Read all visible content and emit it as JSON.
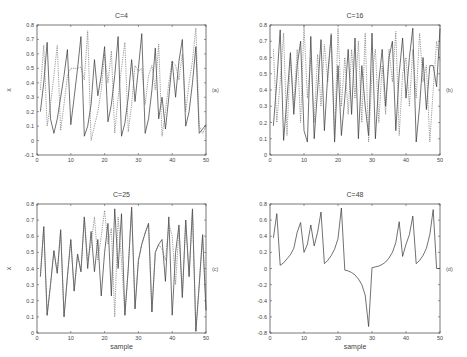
{
  "chart_data": [
    {
      "type": "line",
      "id": "a",
      "title": "C=4",
      "panel_label": "(a)",
      "xlabel": "",
      "ylabel": "x",
      "xlim": [
        0,
        50
      ],
      "ylim": [
        -0.1,
        0.8
      ],
      "xticks": [
        0,
        10,
        20,
        30,
        40,
        50
      ],
      "xtick_labels": [
        "0",
        "10",
        "20",
        "30",
        "40",
        "50"
      ],
      "yticks": [
        -0.1,
        0,
        0.1,
        0.2,
        0.3,
        0.4,
        0.5,
        0.6,
        0.7,
        0.8
      ],
      "ytick_labels": [
        "-0.1",
        "0",
        "0.1",
        "0.2",
        "0.3",
        "0.4",
        "0.5",
        "0.6",
        "0.7",
        "0.8"
      ],
      "grid": false,
      "series": [
        {
          "name": "solid",
          "style": "solid",
          "x": [
            1,
            2,
            3,
            4,
            5,
            6,
            7,
            8,
            9,
            10,
            11,
            12,
            13,
            14,
            15,
            16,
            17,
            18,
            19,
            20,
            21,
            22,
            23,
            24,
            25,
            26,
            27,
            28,
            29,
            30,
            31,
            32,
            33,
            34,
            35,
            36,
            37,
            38,
            39,
            40,
            41,
            42,
            43,
            44,
            45,
            46,
            47,
            48,
            49,
            50
          ],
          "y": [
            0.2,
            0.4,
            0.68,
            0.15,
            0.05,
            0.15,
            0.3,
            0.45,
            0.63,
            0.11,
            0.3,
            0.5,
            0.72,
            0.03,
            0.1,
            0.25,
            0.56,
            0.31,
            0.45,
            0.65,
            0.13,
            0.25,
            0.45,
            0.72,
            0.03,
            0.12,
            0.3,
            0.56,
            0.27,
            0.5,
            0.74,
            0.05,
            0.15,
            0.35,
            0.64,
            0.15,
            0.3,
            0.08,
            0.3,
            0.55,
            0.3,
            0.55,
            0.7,
            0.1,
            0.2,
            0.4,
            0.65,
            0.05,
            0.08,
            0.11
          ]
        },
        {
          "name": "dotted",
          "style": "dotted",
          "x": [
            1,
            2,
            3,
            4,
            5,
            6,
            7,
            8,
            9,
            10,
            11,
            12,
            13,
            14,
            15,
            16,
            17,
            18,
            19,
            20,
            21,
            22,
            23,
            24,
            25,
            26,
            27,
            28,
            29,
            30,
            31,
            32,
            33,
            34,
            35,
            36,
            37,
            38,
            39,
            40,
            41,
            42,
            43,
            44,
            45,
            46,
            47,
            48,
            49,
            50
          ],
          "y": [
            0.35,
            0.66,
            0.1,
            0.25,
            0.45,
            0.66,
            0.07,
            0.25,
            0.45,
            0.5,
            0.5,
            0.5,
            0.51,
            0.42,
            0.76,
            0.0,
            0.1,
            0.2,
            0.35,
            0.6,
            0.4,
            0.62,
            0.05,
            0.3,
            0.5,
            0.68,
            0.06,
            0.25,
            0.52,
            0.48,
            0.5,
            0.25,
            0.45,
            0.52,
            0.35,
            0.67,
            0.03,
            0.2,
            0.4,
            0.55,
            0.52,
            0.42,
            0.6,
            0.2,
            0.4,
            0.55,
            0.78,
            0.1,
            0.05,
            0.1
          ]
        }
      ]
    },
    {
      "type": "line",
      "id": "b",
      "title": "C=16",
      "panel_label": "(b)",
      "xlabel": "",
      "ylabel": "",
      "xlim": [
        0,
        50
      ],
      "ylim": [
        0,
        0.8
      ],
      "xticks": [
        0,
        10,
        20,
        30,
        40,
        50
      ],
      "xtick_labels": [
        "0",
        "10",
        "20",
        "30",
        "40",
        "50"
      ],
      "yticks": [
        0,
        0.1,
        0.2,
        0.3,
        0.4,
        0.5,
        0.6,
        0.7,
        0.8
      ],
      "ytick_labels": [
        "0",
        "0.1",
        "0.2",
        "0.3",
        "0.4",
        "0.5",
        "0.6",
        "0.7",
        "0.8"
      ],
      "grid": false,
      "series": [
        {
          "name": "solid",
          "style": "solid",
          "x": [
            1,
            2,
            3,
            4,
            5,
            6,
            7,
            8,
            9,
            10,
            11,
            12,
            13,
            14,
            15,
            16,
            17,
            18,
            19,
            20,
            21,
            22,
            23,
            24,
            25,
            26,
            27,
            28,
            29,
            30,
            31,
            32,
            33,
            34,
            35,
            36,
            37,
            38,
            39,
            40,
            41,
            42,
            43,
            44,
            45,
            46,
            47,
            48,
            49,
            50
          ],
          "y": [
            0.18,
            0.45,
            0.77,
            0.09,
            0.35,
            0.63,
            0.25,
            0.55,
            0.7,
            0.15,
            0.08,
            0.73,
            0.1,
            0.4,
            0.71,
            0.15,
            0.5,
            0.74,
            0.08,
            0.55,
            0.12,
            0.35,
            0.65,
            0.25,
            0.72,
            0.1,
            0.55,
            0.3,
            0.12,
            0.75,
            0.1,
            0.45,
            0.65,
            0.3,
            0.6,
            0.7,
            0.15,
            0.5,
            0.72,
            0.35,
            0.6,
            0.78,
            0.08,
            0.3,
            0.6,
            0.28,
            0.55,
            0.55,
            0.42,
            0.78
          ]
        },
        {
          "name": "dotted",
          "style": "dotted",
          "x": [
            1,
            2,
            3,
            4,
            5,
            6,
            7,
            8,
            9,
            10,
            11,
            12,
            13,
            14,
            15,
            16,
            17,
            18,
            19,
            20,
            21,
            22,
            23,
            24,
            25,
            26,
            27,
            28,
            29,
            30,
            31,
            32,
            33,
            34,
            35,
            36,
            37,
            38,
            39,
            40,
            41,
            42,
            43,
            44,
            45,
            46,
            47,
            48,
            49,
            50
          ],
          "y": [
            0.65,
            0.2,
            0.45,
            0.75,
            0.12,
            0.6,
            0.3,
            0.65,
            0.2,
            0.8,
            0.35,
            0.6,
            0.2,
            0.62,
            0.3,
            0.68,
            0.45,
            0.75,
            0.1,
            0.78,
            0.3,
            0.6,
            0.25,
            0.65,
            0.35,
            0.7,
            0.2,
            0.75,
            0.08,
            0.5,
            0.65,
            0.2,
            0.55,
            0.25,
            0.65,
            0.45,
            0.76,
            0.12,
            0.5,
            0.6,
            0.3,
            0.65,
            0.35,
            0.75,
            0.45,
            0.55,
            0.08,
            0.4,
            0.7,
            0.58
          ]
        }
      ]
    },
    {
      "type": "line",
      "id": "c",
      "title": "C=25",
      "panel_label": "(c)",
      "xlabel": "sample",
      "ylabel": "x",
      "xlim": [
        0,
        50
      ],
      "ylim": [
        0,
        0.8
      ],
      "xticks": [
        0,
        10,
        20,
        30,
        40,
        50
      ],
      "xtick_labels": [
        "0",
        "10",
        "20",
        "30",
        "40",
        "50"
      ],
      "yticks": [
        0,
        0.1,
        0.2,
        0.3,
        0.4,
        0.5,
        0.6,
        0.7,
        0.8
      ],
      "ytick_labels": [
        "0",
        "0.1",
        "0.2",
        "0.3",
        "0.4",
        "0.5",
        "0.6",
        "0.7",
        "0.8"
      ],
      "grid": false,
      "series": [
        {
          "name": "solid",
          "style": "solid",
          "x": [
            1,
            2,
            3,
            4,
            5,
            6,
            7,
            8,
            9,
            10,
            11,
            12,
            13,
            14,
            15,
            16,
            17,
            18,
            19,
            20,
            21,
            22,
            23,
            24,
            25,
            26,
            27,
            28,
            29,
            30,
            31,
            32,
            33,
            34,
            35,
            36,
            37,
            38,
            39,
            40,
            41,
            42,
            43,
            44,
            45,
            46,
            47,
            48,
            49,
            50
          ],
          "y": [
            0.35,
            0.66,
            0.11,
            0.3,
            0.51,
            0.37,
            0.64,
            0.1,
            0.35,
            0.58,
            0.26,
            0.49,
            0.38,
            0.72,
            0.4,
            0.63,
            0.38,
            0.58,
            0.23,
            0.5,
            0.68,
            0.23,
            0.77,
            0.4,
            0.74,
            0.11,
            0.4,
            0.78,
            0.15,
            0.45,
            0.55,
            0.62,
            0.68,
            0.13,
            0.5,
            0.55,
            0.58,
            0.32,
            0.72,
            0.11,
            0.5,
            0.67,
            0.22,
            0.7,
            0.35,
            0.77,
            0.01,
            0.3,
            0.61,
            0.14
          ]
        },
        {
          "name": "dotted",
          "style": "dotted",
          "x": [
            1,
            2,
            3,
            4,
            5,
            6,
            7,
            8,
            9,
            10,
            11,
            12,
            13,
            14,
            15,
            16,
            17,
            18,
            19,
            20,
            21,
            22,
            23,
            24,
            25,
            26,
            27,
            28,
            29,
            30,
            31,
            32,
            33,
            34,
            35,
            36,
            37,
            38,
            39,
            40,
            41,
            42,
            43,
            44,
            45,
            46,
            47,
            48,
            49,
            50
          ],
          "y": [
            0.35,
            0.66,
            0.11,
            0.3,
            0.51,
            0.37,
            0.64,
            0.1,
            0.35,
            0.58,
            0.26,
            0.49,
            0.38,
            0.72,
            0.45,
            0.55,
            0.72,
            0.45,
            0.6,
            0.76,
            0.55,
            0.65,
            0.1,
            0.72,
            0.45,
            0.11,
            0.4,
            0.78,
            0.15,
            0.45,
            0.55,
            0.62,
            0.68,
            0.13,
            0.5,
            0.55,
            0.52,
            0.45,
            0.68,
            0.6,
            0.3,
            0.65,
            0.22,
            0.7,
            0.35,
            0.77,
            0.01,
            0.3,
            0.61,
            0.14
          ]
        }
      ]
    },
    {
      "type": "line",
      "id": "d",
      "title": "C=48",
      "panel_label": "(d)",
      "xlabel": "sample",
      "ylabel": "",
      "xlim": [
        0,
        50
      ],
      "ylim": [
        -0.8,
        0.8
      ],
      "xticks": [
        0,
        10,
        20,
        30,
        40,
        50
      ],
      "xtick_labels": [
        "0",
        "10",
        "20",
        "30",
        "40",
        "50"
      ],
      "yticks": [
        -0.8,
        -0.6,
        -0.4,
        -0.2,
        0,
        0.2,
        0.4,
        0.6,
        0.8
      ],
      "ytick_labels": [
        "-0.8",
        "-0.6",
        "-0.4",
        "-0.2",
        "0",
        "0.2",
        "0.4",
        "0.6",
        "0.8"
      ],
      "grid": false,
      "series": [
        {
          "name": "solid",
          "style": "solid",
          "x": [
            1,
            2,
            3,
            4,
            5,
            6,
            7,
            8,
            9,
            10,
            11,
            12,
            13,
            14,
            15,
            16,
            17,
            18,
            19,
            20,
            21,
            22,
            23,
            24,
            25,
            26,
            27,
            28,
            29,
            30,
            31,
            32,
            33,
            34,
            35,
            36,
            37,
            38,
            39,
            40,
            41,
            42,
            43,
            44,
            45,
            46,
            47,
            48,
            49,
            50
          ],
          "y": [
            0.38,
            0.68,
            0.04,
            0.07,
            0.12,
            0.17,
            0.25,
            0.45,
            0.57,
            0.2,
            0.3,
            0.54,
            0.28,
            0.45,
            0.7,
            0.06,
            0.1,
            0.16,
            0.24,
            0.37,
            0.75,
            -0.02,
            -0.03,
            -0.05,
            -0.08,
            -0.13,
            -0.2,
            -0.33,
            -0.72,
            0.01,
            0.02,
            0.03,
            0.05,
            0.08,
            0.13,
            0.2,
            0.32,
            0.58,
            0.15,
            0.3,
            0.42,
            0.65,
            0.06,
            0.1,
            0.16,
            0.25,
            0.42,
            0.73,
            0.0,
            0.0
          ]
        }
      ]
    }
  ]
}
